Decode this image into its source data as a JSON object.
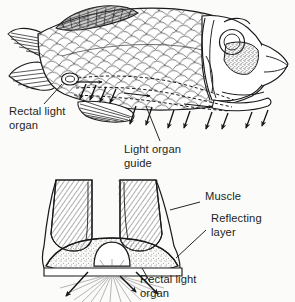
{
  "figure": {
    "panels": [
      {
        "id": "upper",
        "name": "whole-fish-lateral-view",
        "description": "Lateral view of a scaled fish showing dashed light-guide channels running from the rectal light organ forward along the ventral body, with light emission arrows directed downward"
      },
      {
        "id": "lower",
        "name": "cross-section-detail",
        "description": "Transverse section through the ventral body showing paired muscle blocks, the reflecting layer and the rectal light organ emitting light downward"
      }
    ]
  },
  "labels": {
    "rectal_light_organ_upper": {
      "line1": "Rectal light",
      "line2": "organ"
    },
    "light_organ_guide": {
      "line1": "Light organ",
      "line2": "guide"
    },
    "muscle": {
      "line1": "Muscle"
    },
    "reflecting_layer": {
      "line1": "Reflecting",
      "line2": "layer"
    },
    "rectal_light_organ_lower": {
      "line1": "Rectal light",
      "line2": "organ"
    }
  },
  "colors": {
    "background": "#fbfbfa",
    "ink": "#231f20",
    "line": "#1a1a1a",
    "fin_dark": "#4a4a4a",
    "stipple": "#8a8a8a",
    "ray_light": "#9a9a9a"
  }
}
